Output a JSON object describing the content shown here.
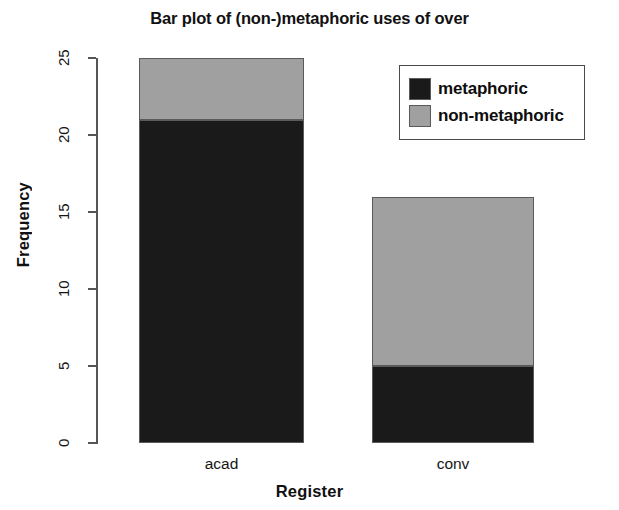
{
  "chart_data": {
    "type": "bar",
    "subtype": "stacked",
    "title": "Bar plot of (non-)metaphoric uses of over",
    "xlabel": "Register",
    "ylabel": "Frequency",
    "categories": [
      "acad",
      "conv"
    ],
    "series": [
      {
        "name": "metaphoric",
        "values": [
          21,
          5
        ],
        "color": "#1a1a1a"
      },
      {
        "name": "non-metaphoric",
        "values": [
          4,
          11
        ],
        "color": "#a0a0a0"
      }
    ],
    "totals": [
      25,
      16
    ],
    "ylim": [
      0,
      26
    ],
    "yticks": [
      0,
      5,
      10,
      15,
      20,
      25
    ],
    "ytick_labels": [
      "0",
      "5",
      "10",
      "15",
      "20",
      "25"
    ],
    "grid": false,
    "legend_position": "top-right"
  },
  "legend": {
    "entries": [
      {
        "label": "metaphoric",
        "color": "#1a1a1a"
      },
      {
        "label": "non-metaphoric",
        "color": "#a0a0a0"
      }
    ]
  }
}
